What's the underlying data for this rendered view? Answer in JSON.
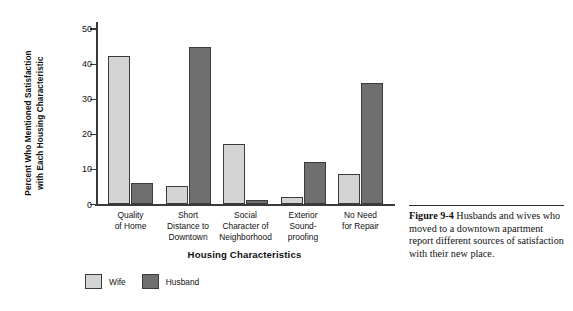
{
  "chart_data": {
    "type": "bar",
    "title": "",
    "xlabel": "Housing Characteristics",
    "ylabel": "Percent Who Mentioned Satisfaction with Each Housing Characteristic",
    "ylabel_lines": [
      "Percent Who Mentioned Satisfaction",
      "with Each Housing Characteristic"
    ],
    "categories": [
      "Quality of Home",
      "Short Distance to Downtown",
      "Social Character of Neighborhood",
      "Exterior Sound-proofing",
      "No Need for Repair"
    ],
    "category_label_lines": [
      [
        "Quality",
        "of Home"
      ],
      [
        "Short",
        "Distance to",
        "Downtown"
      ],
      [
        "Social",
        "Character of",
        "Neighborhood"
      ],
      [
        "Exterior",
        "Sound-",
        "proofing"
      ],
      [
        "No Need",
        "for Repair"
      ]
    ],
    "series": [
      {
        "name": "Wife",
        "color": "#d4d4d4",
        "values": [
          42,
          5,
          17,
          2,
          8.5
        ]
      },
      {
        "name": "Husband",
        "color": "#6f6f6f",
        "values": [
          6,
          44.5,
          1,
          12,
          34.5
        ]
      }
    ],
    "ylim": [
      0,
      52
    ],
    "yticks": [
      0,
      10,
      20,
      30,
      40,
      50
    ],
    "ytick_labels": [
      "0",
      "10",
      "20",
      "30",
      "40",
      "50"
    ],
    "grid": false,
    "legend_position": "below-left"
  },
  "legend": {
    "items": [
      {
        "label": "Wife",
        "color": "#d4d4d4"
      },
      {
        "label": "Husband",
        "color": "#6f6f6f"
      }
    ]
  },
  "caption": {
    "figure_number": "Figure 9-4",
    "text": "Husbands and wives who moved to a downtown apartment report different sources of satisfaction with their new place."
  }
}
